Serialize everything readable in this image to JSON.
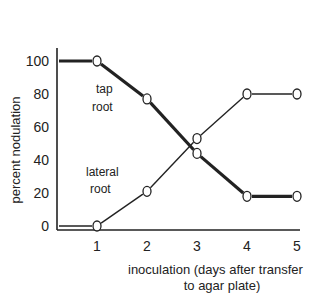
{
  "chart_data": {
    "type": "line",
    "title": "",
    "xlabel": "inoculation  (days after transfer to agar plate)",
    "xlabel_line1": "inoculation  (days after transfer",
    "xlabel_line2": "to agar plate)",
    "ylabel": "percent nodulation",
    "x_ticks": [
      1,
      2,
      3,
      4,
      5
    ],
    "y_ticks": [
      0,
      20,
      40,
      60,
      80,
      100
    ],
    "xlim": [
      0,
      5
    ],
    "ylim": [
      0,
      100
    ],
    "grid": false,
    "series": [
      {
        "name": "tap root",
        "label_line1": "tap",
        "label_line2": "root",
        "style": "thick",
        "x": [
          0,
          1,
          2,
          3,
          4,
          5
        ],
        "values": [
          100,
          100,
          77,
          44,
          18,
          18
        ]
      },
      {
        "name": "lateral root",
        "label_line1": "lateral",
        "label_line2": "root",
        "style": "thin",
        "x": [
          0,
          1,
          2,
          3,
          4,
          5
        ],
        "values": [
          0,
          0,
          21,
          53,
          80,
          80
        ]
      }
    ]
  }
}
